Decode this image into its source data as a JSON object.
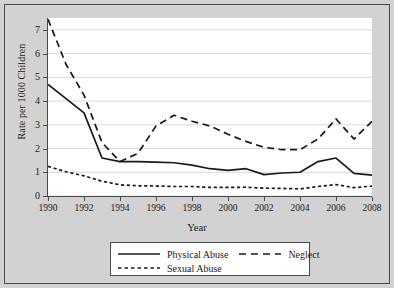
{
  "chart_data": {
    "type": "line",
    "title": "",
    "xlabel": "Year",
    "ylabel": "Rate per 1000 Children",
    "xlim": [
      1990,
      2008
    ],
    "ylim": [
      0,
      7.5
    ],
    "yticks": [
      0,
      1,
      2,
      3,
      4,
      5,
      6,
      7
    ],
    "xticks": [
      1990,
      1992,
      1994,
      1996,
      1998,
      2000,
      2002,
      2004,
      2006,
      2008
    ],
    "grid": "horizontal",
    "legend_position": "below-axes",
    "x": [
      1990,
      1991,
      1992,
      1993,
      1994,
      1995,
      1996,
      1997,
      1998,
      1999,
      2000,
      2001,
      2002,
      2003,
      2004,
      2005,
      2006,
      2007,
      2008
    ],
    "series": [
      {
        "name": "Physical Abuse",
        "style": "solid",
        "color": "#1a1a1a",
        "values": [
          4.7,
          4.1,
          3.5,
          1.6,
          1.45,
          1.45,
          1.43,
          1.4,
          1.3,
          1.15,
          1.08,
          1.15,
          0.9,
          0.97,
          1.0,
          1.45,
          1.6,
          0.95,
          0.88
        ]
      },
      {
        "name": "Neglect",
        "style": "long-dash",
        "color": "#1a1a1a",
        "values": [
          7.45,
          5.55,
          4.25,
          2.25,
          1.45,
          1.8,
          2.95,
          3.4,
          3.15,
          2.95,
          2.6,
          2.3,
          2.05,
          1.95,
          1.95,
          2.4,
          3.25,
          2.4,
          3.15
        ]
      },
      {
        "name": "Sexual Abuse",
        "style": "short-dash",
        "color": "#1a1a1a",
        "values": [
          1.25,
          1.02,
          0.85,
          0.62,
          0.47,
          0.43,
          0.42,
          0.4,
          0.4,
          0.36,
          0.36,
          0.37,
          0.33,
          0.32,
          0.3,
          0.4,
          0.48,
          0.35,
          0.42
        ]
      }
    ],
    "ytick_labels": [
      "0",
      "1",
      "2",
      "3",
      "4",
      "5",
      "6",
      "7"
    ],
    "xtick_labels": [
      "1990",
      "1992",
      "1994",
      "1996",
      "1998",
      "2000",
      "2002",
      "2004",
      "2006",
      "2008"
    ]
  },
  "legend": {
    "items": [
      {
        "label": "Physical Abuse",
        "style": "solid"
      },
      {
        "label": "Neglect",
        "style": "long-dash"
      },
      {
        "label": "Sexual Abuse",
        "style": "short-dash"
      }
    ]
  },
  "colors": {
    "figure_background": "#d2d2d2",
    "plot_background": "#ffffff",
    "line": "#1a1a1a",
    "grid": "#d9d9d9",
    "frame": "#4a4a4a"
  }
}
